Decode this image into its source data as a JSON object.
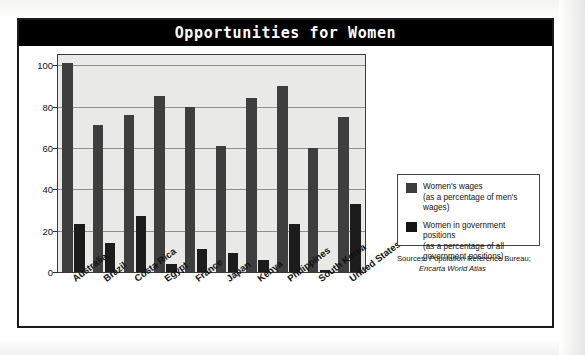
{
  "title": "Opportunities for Women",
  "chart_data": {
    "type": "bar",
    "title": "Opportunities for Women",
    "xlabel": "",
    "ylabel": "Percent",
    "ylim": [
      0,
      105
    ],
    "yticks": [
      0,
      20,
      40,
      60,
      80,
      100
    ],
    "grid": true,
    "legend_position": "right",
    "categories": [
      "Australia",
      "Brazil",
      "Costa Rica",
      "Egypt",
      "France",
      "Japan",
      "Kenya",
      "Philippines",
      "South Korea",
      "United States"
    ],
    "series": [
      {
        "name": "Women's wages",
        "sublabel": "(as a percentage of men's wages)",
        "color": "#3e3e3e",
        "values": [
          101,
          71,
          76,
          85,
          80,
          61,
          84,
          90,
          60,
          75
        ]
      },
      {
        "name": "Women in government positions",
        "sublabel": "(as a percentage of all government positions)",
        "color": "#1c1c1c",
        "values": [
          23,
          14,
          27,
          4,
          11,
          9,
          6,
          23,
          1,
          33
        ]
      }
    ],
    "sources": "Sources: Population Reference Bureau; Encarta World Atlas"
  },
  "legend": {
    "items": [
      {
        "label": "Women's wages",
        "sublabel": "(as a percentage of men's wages)",
        "color": "#3e3e3e"
      },
      {
        "label": "Women in government positions",
        "sublabel": "(as a percentage of all government positions)",
        "color": "#1c1c1c"
      }
    ]
  },
  "sources": {
    "line1": "Sources: Population Reference Bureau;",
    "line2": "Encarta World Atlas"
  },
  "axis": {
    "y_title": "Percent",
    "y_ticks": [
      "100",
      "80",
      "60",
      "40",
      "20",
      "0"
    ]
  }
}
